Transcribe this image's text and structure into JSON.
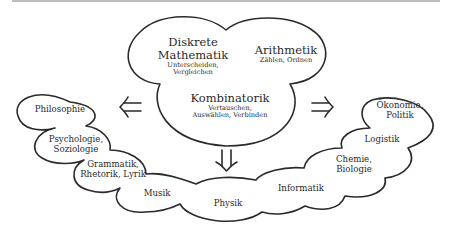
{
  "center_cloud": {
    "diskrete": {
      "title_line1": "Diskrete",
      "title_line2": "Mathematik",
      "sub_line1": "Unterscheiden,",
      "sub_line2": "Vergleichen"
    },
    "arithmetik": {
      "title": "Arithmetik",
      "sub": "Zählen, Ordnen"
    },
    "kombinatorik": {
      "title": "Kombinatorik",
      "sub_line1": "Vertauschen,",
      "sub_line2": "Auswählen, Verbinden"
    }
  },
  "arrows": {
    "left": "left-double-arrow",
    "right": "right-double-arrow",
    "down": "down-double-arrow"
  },
  "application_clouds": {
    "philosophie": "Philosophie",
    "psychologie": {
      "line1": "Psychologie,",
      "line2": "Soziologie"
    },
    "grammatik": {
      "line1": "Grammatik,",
      "line2": "Rhetorik, Lyrik"
    },
    "musik": "Musik",
    "physik": "Physik",
    "informatik": "Informatik",
    "chemie": {
      "line1": "Chemie,",
      "line2": "Biologie"
    },
    "logistik": "Logistik",
    "oekonomie": {
      "line1": "Ökonomie,",
      "line2": "Politik"
    }
  },
  "colors": {
    "stroke": "#2a2a2a",
    "background": "#ffffff",
    "top_rule": "#bdbdbd"
  }
}
